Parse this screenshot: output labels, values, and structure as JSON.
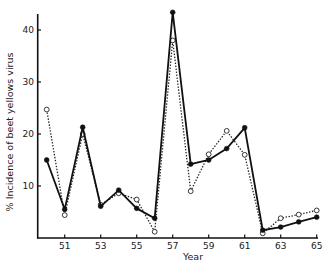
{
  "chart_data": {
    "type": "line",
    "title": "",
    "xlabel": "Year",
    "ylabel": "% Incidence of beet yellows virus",
    "x": [
      50,
      51,
      52,
      53,
      54,
      55,
      56,
      57,
      58,
      59,
      60,
      61,
      62,
      63,
      64,
      65
    ],
    "x_tick_labels": [
      "51",
      "53",
      "55",
      "57",
      "59",
      "61",
      "63",
      "65"
    ],
    "x_ticks": [
      51,
      53,
      55,
      57,
      59,
      61,
      63,
      65
    ],
    "y_ticks": [
      10,
      20,
      30,
      40
    ],
    "y_tick_labels": [
      "10",
      "20",
      "30",
      "40"
    ],
    "xlim": [
      50,
      65
    ],
    "ylim": [
      0,
      43
    ],
    "grid": false,
    "legend": null,
    "series": [
      {
        "name": "solid line (filled markers)",
        "style": "solid",
        "marker": "filled-circle",
        "values": [
          15.0,
          5.5,
          21.3,
          6.1,
          9.2,
          5.7,
          3.8,
          43.4,
          14.2,
          15.0,
          17.2,
          21.2,
          1.5,
          2.1,
          3.1,
          4.0
        ]
      },
      {
        "name": "dotted line (open markers)",
        "style": "dotted",
        "marker": "open-circle",
        "values": [
          24.7,
          4.4,
          20.0,
          6.4,
          8.6,
          7.4,
          1.2,
          38.0,
          9.0,
          16.1,
          20.6,
          16.0,
          0.9,
          3.8,
          4.5,
          5.3
        ]
      }
    ]
  }
}
